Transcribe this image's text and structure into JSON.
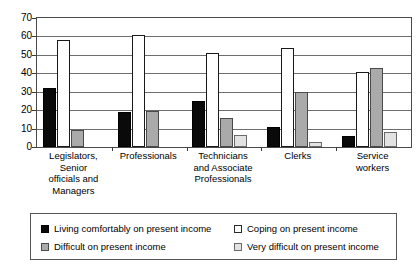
{
  "chart_data": {
    "type": "bar",
    "title": "",
    "subtitle": "",
    "xlabel": "",
    "ylabel": "",
    "ylim": [
      0,
      70
    ],
    "yticks": [
      0,
      10,
      20,
      30,
      40,
      50,
      60,
      70
    ],
    "grid": true,
    "legend_position": "bottom",
    "categories": [
      "Legislators, Senior officials and Managers",
      "Professionals",
      "Technicians and Associate Professionals",
      "Clerks",
      "Service workers"
    ],
    "category_lines": [
      [
        "Legislators,",
        "Senior",
        "officials and",
        "Managers"
      ],
      [
        "Professionals"
      ],
      [
        "Technicians",
        "and Associate",
        "Professionals"
      ],
      [
        "Clerks"
      ],
      [
        "Service",
        "workers"
      ]
    ],
    "series": [
      {
        "name": "Living comfortably on present income",
        "color": "#0a0a0a",
        "values": [
          32,
          19,
          25,
          11,
          6
        ]
      },
      {
        "name": "Coping on present income",
        "color": "#ffffff",
        "values": [
          58,
          61,
          51,
          54,
          40.5
        ]
      },
      {
        "name": "Difficult on present income",
        "color": "#aaaaaa",
        "values": [
          9.5,
          19.5,
          15.5,
          30,
          43
        ]
      },
      {
        "name": "Very difficult on present income",
        "color": "#e2e2e2",
        "values": [
          0,
          0,
          6.5,
          2.5,
          8
        ]
      }
    ]
  },
  "legend": {
    "items": [
      {
        "label": "Living comfortably on present income",
        "swatch": "black-swatch"
      },
      {
        "label": "Coping on present income",
        "swatch": "white-swatch"
      },
      {
        "label": "Difficult on present income",
        "swatch": "gray-swatch"
      },
      {
        "label": "Very difficult on present income",
        "swatch": "light-gray-swatch"
      }
    ]
  },
  "axis": {
    "y_tick_labels": [
      "70",
      "60",
      "50",
      "40",
      "30",
      "20",
      "10",
      "0"
    ]
  }
}
